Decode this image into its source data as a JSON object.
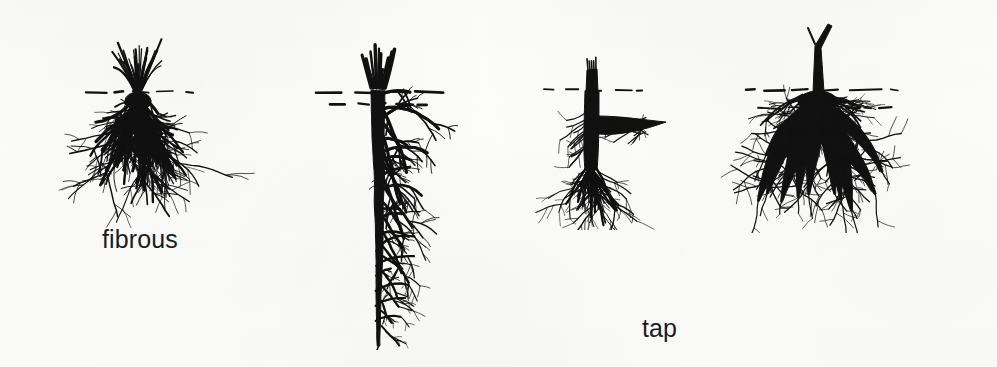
{
  "figure": {
    "background_color": "#fdfdfc",
    "ink_color": "#111111"
  },
  "specimens": [
    {
      "id": "fibrous",
      "label": "fibrous",
      "type": "fibrous-root-system",
      "soil_line_y": 64,
      "shoot_description": "dense spray of fine upright leaf blades rising from the crown",
      "root_description": "broad bushy mass of many fine roots of roughly equal thickness spreading downward and outward, no dominant central root"
    },
    {
      "id": "tap",
      "label": "tap",
      "type": "tap-root-system",
      "soil_line_y": 62,
      "shoot_description": "short cluster of stubby cut stems at the crown",
      "root_description": "one thick dominant vertical taproot descending far below the others with many slender lateral branches along its length"
    },
    {
      "id": "woody",
      "label": "woody",
      "type": "woody-root-system",
      "soil_line_y": 50,
      "shoot_description": "single stout cut-off woody stem",
      "root_description": "thick rigid trunk-like root with one heavy horizontal lateral branch and a brush of finer roots at the base"
    },
    {
      "id": "tuberous",
      "label": "tuberous",
      "type": "tuberous-root-system",
      "soil_line_y": 72,
      "shoot_description": "tall slender cut stem rising well above the soil line",
      "root_description": "cluster of swollen, thickened storage roots radiating outward and downward with fine fibrous rootlets branching off them"
    }
  ]
}
